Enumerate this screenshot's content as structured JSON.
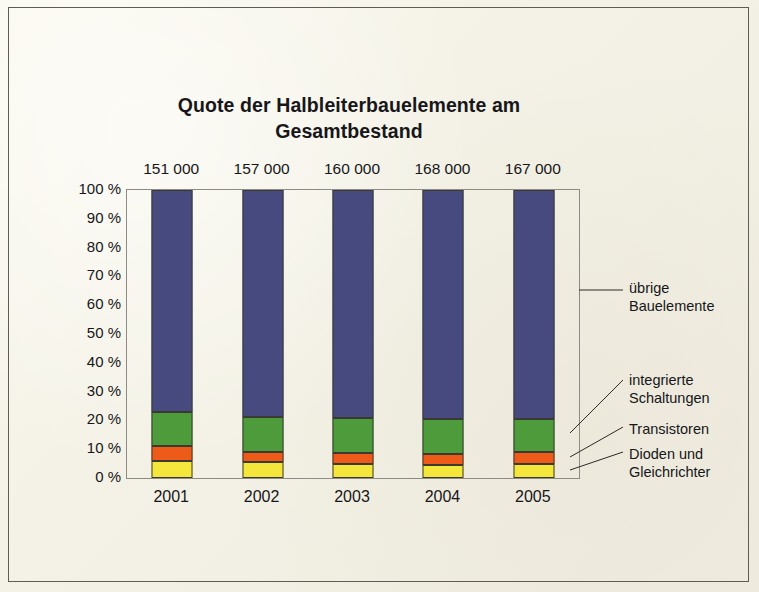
{
  "figure": {
    "title": "Quote der Halbleiterbauelemente am Gesamtbestand"
  },
  "chart_data": {
    "type": "bar",
    "subtype": "stacked-percentage",
    "title": "Quote der Halbleiterbauelemente am Gesamtbestand",
    "xlabel": "",
    "ylabel": "",
    "ylim": [
      0,
      100
    ],
    "yticks": [
      0,
      10,
      20,
      30,
      40,
      50,
      60,
      70,
      80,
      90,
      100
    ],
    "ytick_labels": [
      "0 %",
      "10 %",
      "20 %",
      "30 %",
      "40 %",
      "50 %",
      "60 %",
      "70 %",
      "80 %",
      "90 %",
      "100 %"
    ],
    "categories": [
      "2001",
      "2002",
      "2003",
      "2004",
      "2005"
    ],
    "category_totals": [
      "151 000",
      "157 000",
      "160 000",
      "168 000",
      "167 000"
    ],
    "grid": false,
    "legend_position": "right-callouts",
    "series": [
      {
        "name": "Dioden und Gleichrichter",
        "color": "#f5e63c",
        "values": [
          5.9,
          5.6,
          4.9,
          4.5,
          4.9
        ]
      },
      {
        "name": "Transistoren",
        "color": "#ee5a18",
        "values": [
          5.1,
          3.4,
          3.8,
          3.8,
          4.1
        ]
      },
      {
        "name": "integrierte Schaltungen",
        "color": "#4e9b3c",
        "values": [
          12.0,
          12.2,
          12.1,
          12.2,
          11.5
        ]
      },
      {
        "name": "übrige Bauelemente",
        "color": "#474a7e",
        "values": [
          77.0,
          78.8,
          79.2,
          79.5,
          79.5
        ]
      }
    ],
    "annotations": [
      {
        "id": "uebrige",
        "text": "übrige\nBauelemente"
      },
      {
        "id": "integrierte",
        "text": "integrierte\nSchaltungen"
      },
      {
        "id": "transistoren",
        "text": "Transistoren"
      },
      {
        "id": "dioden",
        "text": "Dioden und\nGleichrichter"
      }
    ]
  }
}
